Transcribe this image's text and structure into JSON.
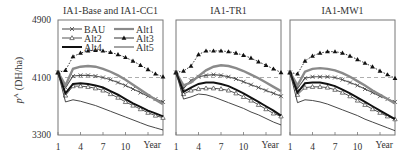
{
  "figure": {
    "ylabel": "pA (DH/ha)",
    "ylabel_main": "p",
    "ylabel_sup": "A",
    "ylabel_unit": "(DH/ha)",
    "xlabel": "Year",
    "y_ticks": [
      "4900",
      "4100",
      "3300"
    ],
    "x_ticks": [
      "1",
      "4",
      "7",
      "10"
    ]
  },
  "chart_data": [
    {
      "type": "line",
      "title": "IA1-Base and IA1-CC1",
      "xlabel": "Year",
      "ylabel": "pA (DH/ha)",
      "ylim": [
        3300,
        4900
      ],
      "x": [
        1,
        2,
        3,
        4,
        5,
        6,
        7,
        8,
        9,
        10,
        11,
        12,
        13,
        14,
        15
      ],
      "reference_line": {
        "y": 4100,
        "style": "dashed"
      },
      "legend_position": "upper inside, two columns",
      "series": [
        {
          "name": "BAU",
          "marker": "x",
          "values": [
            4170,
            3960,
            4120,
            4130,
            4130,
            4120,
            4100,
            4070,
            4030,
            3990,
            3940,
            3890,
            3840,
            3800,
            3760
          ]
        },
        {
          "name": "Alt1",
          "marker": "none-gray-thick",
          "values": [
            4170,
            3990,
            4220,
            4250,
            4260,
            4250,
            4220,
            4180,
            4130,
            4070,
            4000,
            3930,
            3860,
            3790,
            3730
          ]
        },
        {
          "name": "Alt2",
          "marker": "open-triangle",
          "values": [
            4170,
            3850,
            3980,
            3980,
            3970,
            3950,
            3920,
            3870,
            3820,
            3760,
            3710,
            3660,
            3610,
            3570,
            3540
          ]
        },
        {
          "name": "Alt3",
          "marker": "filled-triangle",
          "values": [
            4170,
            4200,
            4390,
            4440,
            4470,
            4480,
            4470,
            4450,
            4420,
            4380,
            4330,
            4270,
            4210,
            4150,
            4110
          ]
        },
        {
          "name": "Alt4",
          "marker": "none-black-thick",
          "values": [
            4170,
            3880,
            4010,
            4020,
            4010,
            3990,
            3960,
            3910,
            3860,
            3800,
            3740,
            3690,
            3640,
            3600,
            3560
          ]
        },
        {
          "name": "Alt5",
          "marker": "none-thin",
          "values": [
            4170,
            3760,
            3790,
            3770,
            3740,
            3710,
            3670,
            3630,
            3590,
            3550,
            3510,
            3470,
            3430,
            3400,
            3370
          ]
        }
      ]
    },
    {
      "type": "line",
      "title": "IA1-TR1",
      "xlabel": "Year",
      "ylim": [
        3300,
        4900
      ],
      "x": [
        1,
        2,
        3,
        4,
        5,
        6,
        7,
        8,
        9,
        10,
        11,
        12,
        13,
        14,
        15
      ],
      "reference_line": {
        "y": 4100,
        "style": "dashed"
      },
      "series": [
        {
          "name": "BAU",
          "values": [
            4170,
            3950,
            4060,
            4110,
            4130,
            4140,
            4130,
            4110,
            4080,
            4040,
            4000,
            3960,
            3920,
            3880,
            3840
          ]
        },
        {
          "name": "Alt1",
          "values": [
            4170,
            3990,
            4030,
            4120,
            4200,
            4250,
            4270,
            4260,
            4230,
            4190,
            4140,
            4090,
            4030,
            3970,
            3910
          ]
        },
        {
          "name": "Alt2",
          "values": [
            4170,
            3870,
            3920,
            3940,
            3950,
            3950,
            3940,
            3920,
            3880,
            3830,
            3780,
            3720,
            3660,
            3600,
            3560
          ]
        },
        {
          "name": "Alt3",
          "values": [
            4170,
            4190,
            4260,
            4420,
            4470,
            4470,
            4470,
            4460,
            4440,
            4410,
            4370,
            4320,
            4270,
            4220,
            4170
          ]
        },
        {
          "name": "Alt4",
          "values": [
            4170,
            3900,
            3960,
            4010,
            4030,
            4030,
            4010,
            3980,
            3930,
            3880,
            3820,
            3760,
            3700,
            3640,
            3570
          ]
        },
        {
          "name": "Alt5",
          "values": [
            4170,
            3800,
            3830,
            3870,
            3860,
            3830,
            3790,
            3750,
            3710,
            3670,
            3620,
            3580,
            3530,
            3480,
            3440
          ]
        }
      ]
    },
    {
      "type": "line",
      "title": "IA1-MW1",
      "xlabel": "Year",
      "ylim": [
        3300,
        4900
      ],
      "x": [
        1,
        2,
        3,
        4,
        5,
        6,
        7,
        8,
        9,
        10,
        11,
        12,
        13,
        14,
        15
      ],
      "reference_line": {
        "y": 4100,
        "style": "dashed"
      },
      "series": [
        {
          "name": "BAU",
          "values": [
            4170,
            3950,
            4090,
            4110,
            4110,
            4110,
            4100,
            4070,
            4030,
            3990,
            3940,
            3890,
            3840,
            3800,
            3760
          ]
        },
        {
          "name": "Alt1",
          "values": [
            4170,
            3990,
            4180,
            4220,
            4230,
            4220,
            4200,
            4160,
            4110,
            4050,
            3990,
            3920,
            3860,
            3800,
            3740
          ]
        },
        {
          "name": "Alt2",
          "values": [
            4170,
            3860,
            3960,
            3970,
            3970,
            3960,
            3930,
            3890,
            3840,
            3780,
            3720,
            3660,
            3610,
            3560,
            3520
          ]
        },
        {
          "name": "Alt3",
          "values": [
            4170,
            4150,
            4330,
            4400,
            4440,
            4460,
            4460,
            4440,
            4400,
            4350,
            4300,
            4250,
            4190,
            4140,
            4090
          ]
        },
        {
          "name": "Alt4",
          "values": [
            4170,
            3890,
            4020,
            4030,
            4030,
            4010,
            3980,
            3930,
            3880,
            3820,
            3760,
            3700,
            3640,
            3580,
            3520
          ]
        },
        {
          "name": "Alt5",
          "values": [
            4170,
            3750,
            3790,
            3780,
            3760,
            3730,
            3690,
            3650,
            3610,
            3570,
            3520,
            3480,
            3440,
            3400,
            3360
          ]
        }
      ]
    }
  ]
}
